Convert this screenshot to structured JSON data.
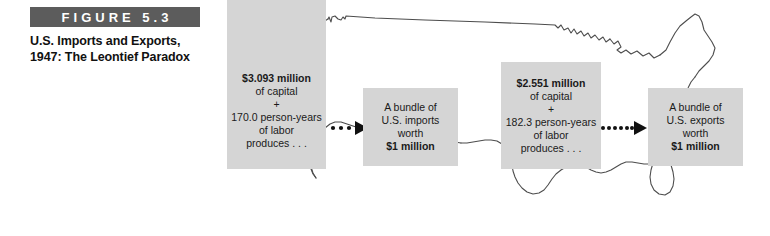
{
  "figure": {
    "label": "FIGURE 5.3",
    "caption_line_1": "U.S. Imports and Exports,",
    "caption_line_2": "1947: The Leontief Paradox",
    "label_bar_color": "#5c5c5c",
    "panel_color": "#d5d5d5",
    "map_outline_color": "#4d4d4d",
    "background_color": "#ffffff"
  },
  "panels": {
    "imports_input": {
      "name": "imports-input-panel",
      "line_1": "$3.093 million",
      "line_2": "of capital",
      "line_3": "+",
      "line_4": "170.0 person-years",
      "line_5": "of labor",
      "line_6": "produces . . ."
    },
    "imports_output": {
      "name": "imports-output-panel",
      "line_1": "A bundle of",
      "line_2": "U.S. imports",
      "line_3": "worth",
      "line_4": "$1 million"
    },
    "exports_input": {
      "name": "exports-input-panel",
      "line_1": "$2.551 million",
      "line_2": "of capital",
      "line_3": "+",
      "line_4": "182.3 person-years",
      "line_5": "of labor",
      "line_6": "produces . . ."
    },
    "exports_output": {
      "name": "exports-output-panel",
      "line_1": "A bundle of",
      "line_2": "U.S. exports",
      "line_3": "worth",
      "line_4": "$1 million"
    }
  },
  "arrows": {
    "imports_arrow": {
      "name": "dotted-arrow-imports",
      "dots": 3,
      "direction": "right"
    },
    "exports_arrow": {
      "name": "dotted-arrow-exports",
      "dots": 6,
      "direction": "right"
    }
  },
  "map": {
    "name": "united-states-outline",
    "description": "Outline map of the contiguous United States"
  }
}
